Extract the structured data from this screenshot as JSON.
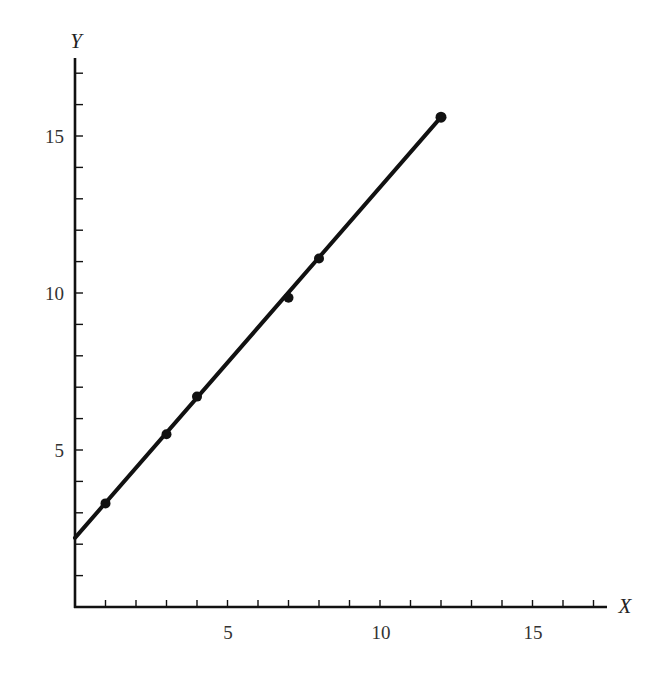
{
  "chart_data": {
    "type": "scatter",
    "title": "",
    "xlabel": "X",
    "ylabel": "Y",
    "xlim": [
      0,
      17.5
    ],
    "ylim": [
      0,
      17.5
    ],
    "grid": false,
    "legend": null,
    "x_ticks": [
      5,
      10,
      15
    ],
    "y_ticks": [
      5,
      10,
      15
    ],
    "x_minor_step": 1,
    "y_minor_step": 1,
    "series": [
      {
        "name": "data points",
        "kind": "scatter",
        "points": [
          {
            "x": 1,
            "y": 3.3
          },
          {
            "x": 3,
            "y": 5.5
          },
          {
            "x": 4,
            "y": 6.7
          },
          {
            "x": 7,
            "y": 9.85
          },
          {
            "x": 8,
            "y": 11.1
          },
          {
            "x": 12,
            "y": 15.6
          }
        ]
      },
      {
        "name": "fitted line",
        "kind": "line",
        "points": [
          {
            "x": 0,
            "y": 2.2
          },
          {
            "x": 12,
            "y": 15.6
          }
        ]
      }
    ]
  },
  "axes": {
    "x_label": "X",
    "y_label": "Y",
    "x_tick_labels": [
      "5",
      "10",
      "15"
    ],
    "y_tick_labels": [
      "5",
      "10",
      "15"
    ]
  },
  "colors": {
    "line": "#111111",
    "axis": "#111111",
    "text": "#333333"
  }
}
